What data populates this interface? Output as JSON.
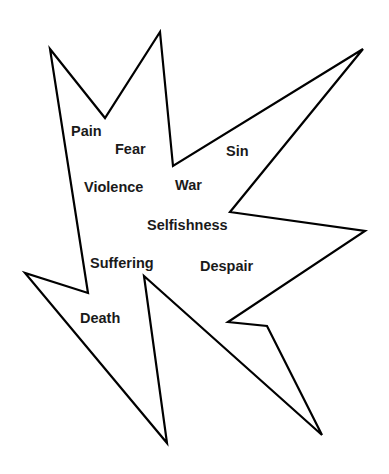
{
  "diagram": {
    "shape": "jagged-burst",
    "stroke_color": "#000000",
    "fill_color": "#ffffff",
    "stroke_width": 2.2,
    "polygon_points": [
      [
        50,
        49
      ],
      [
        105,
        118
      ],
      [
        160,
        32
      ],
      [
        173,
        166
      ],
      [
        363,
        49
      ],
      [
        230,
        212
      ],
      [
        365,
        231
      ],
      [
        228,
        322
      ],
      [
        267,
        326
      ],
      [
        322,
        435
      ],
      [
        144,
        276
      ],
      [
        167,
        443
      ],
      [
        25,
        273
      ],
      [
        88,
        293
      ]
    ],
    "words": [
      {
        "id": "pain",
        "label": "Pain",
        "x": 71,
        "y": 124
      },
      {
        "id": "fear",
        "label": "Fear",
        "x": 115,
        "y": 142
      },
      {
        "id": "sin",
        "label": "Sin",
        "x": 226,
        "y": 144
      },
      {
        "id": "violence",
        "label": "Violence",
        "x": 84,
        "y": 180
      },
      {
        "id": "war",
        "label": "War",
        "x": 175,
        "y": 178
      },
      {
        "id": "selfishness",
        "label": "Selfishness",
        "x": 147,
        "y": 218
      },
      {
        "id": "suffering",
        "label": "Suffering",
        "x": 90,
        "y": 256
      },
      {
        "id": "despair",
        "label": "Despair",
        "x": 200,
        "y": 259
      },
      {
        "id": "death",
        "label": "Death",
        "x": 80,
        "y": 311
      }
    ]
  }
}
